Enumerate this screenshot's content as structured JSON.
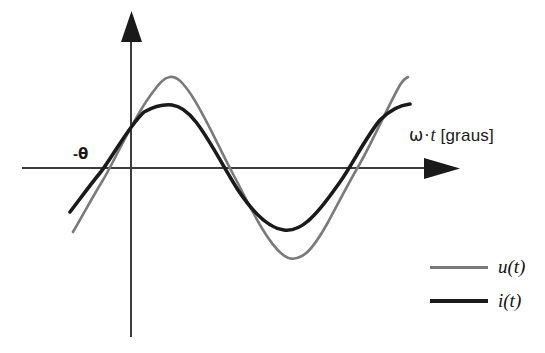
{
  "figure": {
    "background_color": "#ffffff",
    "width": 545,
    "height": 353
  },
  "axes": {
    "x_axis_label": "ω · t [graus]",
    "x_axis_label_parts": {
      "omega": "ω",
      "dot": "·",
      "t": "t",
      "unit": "[graus]"
    },
    "x_axis_color": "#3c3c3c",
    "y_axis_color": "#3c3c3c",
    "phase_marker_label": "-θ",
    "phase_marker_parts": {
      "minus": "-",
      "theta": "θ"
    }
  },
  "legend": {
    "position": "bottom-right",
    "items": [
      {
        "label": "u(t)",
        "color": "#7a7a7a",
        "series": "u"
      },
      {
        "label": "i(t)",
        "color": "#1a1a1a",
        "series": "i"
      }
    ]
  },
  "chart_data": {
    "type": "line",
    "title": "",
    "subtitle": "",
    "xlabel": "ω · t [graus]",
    "ylabel": "",
    "xlim": [
      -60,
      420
    ],
    "ylim": [
      -1.15,
      1.15
    ],
    "grid": false,
    "legend_position": "bottom-right",
    "annotations": [
      {
        "text": "-θ",
        "x": -28,
        "y": 0,
        "description": "phase lag marker at the negative zero crossing of the voltage waveform"
      }
    ],
    "axis_arrows": {
      "x": "right",
      "y": "up"
    },
    "series": [
      {
        "name": "u(t)",
        "color": "#7a7a7a",
        "line_width": 2.6,
        "amplitude": 1.0,
        "phase_deg": 28,
        "period_deg": 360,
        "x": [
          -60,
          -40,
          -28,
          -20,
          0,
          20,
          40,
          62,
          80,
          100,
          120,
          140,
          160,
          180,
          200,
          212,
          220,
          240,
          260,
          280,
          300,
          320,
          332,
          340,
          360,
          380,
          400,
          420
        ],
        "values": [
          -0.91,
          -0.56,
          -0.31,
          -0.14,
          0.36,
          0.74,
          0.95,
          1.0,
          0.96,
          0.81,
          0.57,
          0.28,
          -0.03,
          -0.34,
          -0.62,
          -0.76,
          -0.82,
          -0.96,
          -1.0,
          -0.93,
          -0.77,
          -0.5,
          -0.32,
          -0.2,
          0.18,
          0.53,
          0.8,
          0.96
        ]
      },
      {
        "name": "i(t)",
        "color": "#1a1a1a",
        "line_width": 3.6,
        "amplitude": 0.69,
        "phase_deg": 0,
        "period_deg": 360,
        "x": [
          -60,
          -40,
          -28,
          -20,
          0,
          20,
          40,
          62,
          80,
          90,
          100,
          120,
          140,
          160,
          180,
          200,
          220,
          240,
          260,
          270,
          280,
          300,
          320,
          340,
          360,
          380,
          400,
          420
        ],
        "values": [
          -0.6,
          -0.44,
          -0.32,
          -0.24,
          0.0,
          0.24,
          0.44,
          0.61,
          0.68,
          0.69,
          0.68,
          0.6,
          0.44,
          0.24,
          0.0,
          -0.24,
          -0.44,
          -0.6,
          -0.68,
          -0.69,
          -0.68,
          -0.6,
          -0.44,
          -0.24,
          0.0,
          0.24,
          0.44,
          0.6
        ]
      }
    ]
  }
}
